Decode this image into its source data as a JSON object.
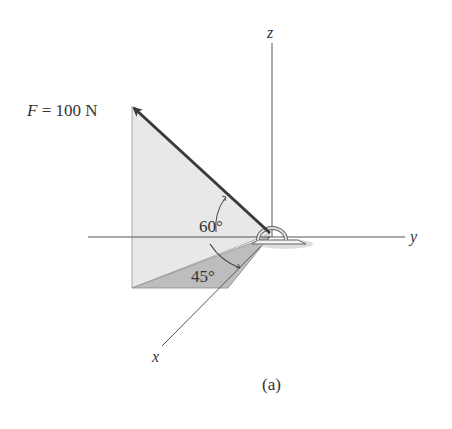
{
  "figure": {
    "caption": "(a)",
    "force_label": "F = 100 N",
    "force_symbol": "F",
    "force_equals": "=",
    "force_value": "100 N",
    "angles": {
      "elevation": "60°",
      "azimuth": "45°"
    },
    "axes": {
      "x": "x",
      "y": "y",
      "z": "z"
    },
    "colors": {
      "axis": "#555555",
      "force": "#3a3a3a",
      "plane_light": "#e6e6e6",
      "plane_dark": "#bdbdbd",
      "text": "#333333"
    }
  }
}
